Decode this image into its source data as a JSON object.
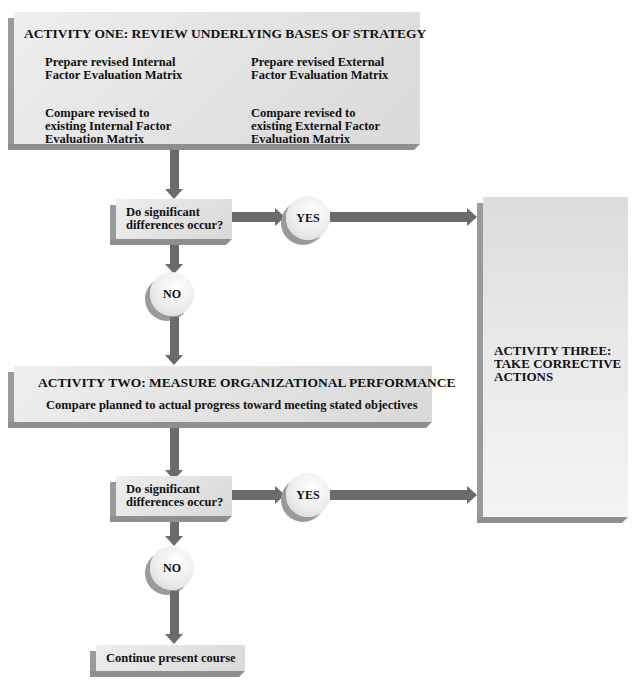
{
  "diagram": {
    "activity_one": {
      "title": "ACTIVITY ONE: REVIEW UNDERLYING BASES OF STRATEGY",
      "items": [
        "Prepare revised Internal Factor Evaluation Matrix",
        "Prepare revised External Factor Evaluation Matrix",
        "Compare revised to existing Internal Factor Evaluation Matrix",
        "Compare revised to existing External Factor Evaluation Matrix"
      ],
      "item_lines": {
        "ife_prep_1": "Prepare revised Internal",
        "ife_prep_2": "Factor Evaluation Matrix",
        "efe_prep_1": "Prepare revised External",
        "efe_prep_2": "Factor Evaluation Matrix",
        "ife_cmp_1": "Compare revised to",
        "ife_cmp_2": "existing Internal Factor",
        "ife_cmp_3": "Evaluation Matrix",
        "efe_cmp_1": "Compare revised to",
        "efe_cmp_2": "existing External Factor",
        "efe_cmp_3": "Evaluation Matrix"
      }
    },
    "decision_one": {
      "line1": "Do significant",
      "line2": "differences occur?",
      "yes_label": "YES",
      "no_label": "NO"
    },
    "activity_two": {
      "title": "ACTIVITY TWO: MEASURE ORGANIZATIONAL PERFORMANCE",
      "subtitle": "Compare planned to actual progress toward meeting stated objectives"
    },
    "decision_two": {
      "line1": "Do significant",
      "line2": "differences occur?",
      "yes_label": "YES",
      "no_label": "NO"
    },
    "activity_three": {
      "line1": "ACTIVITY THREE:",
      "line2": "TAKE CORRECTIVE",
      "line3": "ACTIONS"
    },
    "end": {
      "label": "Continue present course"
    },
    "colors": {
      "box_fill": "#e6e6e6",
      "box_edge": "#9a9a9a",
      "arrow": "#6b6b6b",
      "text": "#111111"
    }
  }
}
